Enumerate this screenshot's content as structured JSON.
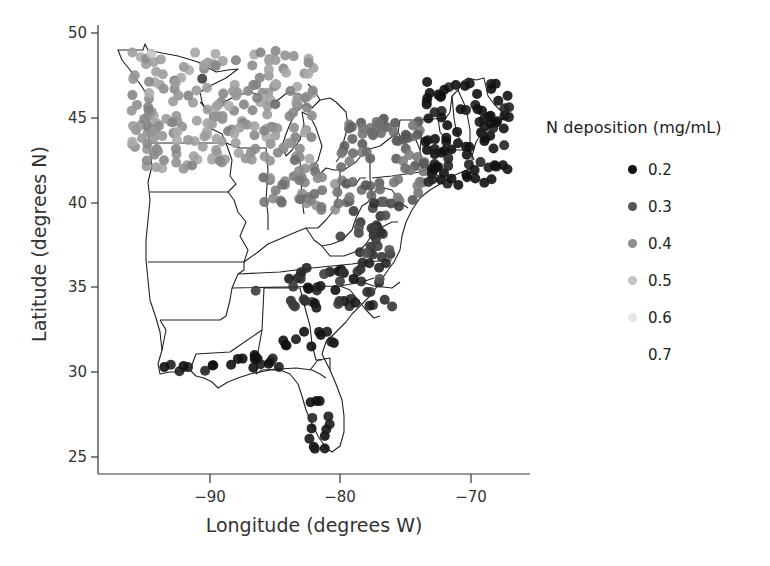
{
  "chart_data": {
    "type": "scatter",
    "subtype": "geographic point map (eastern United States)",
    "title": "",
    "xlabel": "Longitude (degrees W)",
    "ylabel": "Latitude (degrees N)",
    "xlim": [
      -98,
      -65
    ],
    "ylim": [
      24.2,
      50.2
    ],
    "xticks": [
      -90,
      -80,
      -70
    ],
    "xtick_labels": [
      "−90",
      "−80",
      "−70"
    ],
    "yticks": [
      25,
      30,
      35,
      40,
      45,
      50
    ],
    "ytick_labels": [
      "25",
      "30",
      "35",
      "40",
      "45",
      "50"
    ],
    "grid": false,
    "legend": {
      "title": "N deposition (mg/mL)",
      "position": "right",
      "entries": [
        {
          "label": "0.2",
          "value": 0.2,
          "color": "#111111"
        },
        {
          "label": "0.3",
          "value": 0.3,
          "color": "#555555"
        },
        {
          "label": "0.4",
          "value": 0.4,
          "color": "#8e8e8e"
        },
        {
          "label": "0.5",
          "value": 0.5,
          "color": "#c4c4c4"
        },
        {
          "label": "0.6",
          "value": 0.6,
          "color": "#e6e6e6"
        },
        {
          "label": "0.7",
          "value": 0.7,
          "color": "#ffffff"
        }
      ]
    },
    "regions": [
      {
        "name": "Upper Midwest (MN, WI, MI)",
        "lon_range": [
          -96,
          -82
        ],
        "lat_range": [
          42,
          49
        ],
        "approx_value": 0.5
      },
      {
        "name": "Ohio / Indiana",
        "lon_range": [
          -86,
          -80
        ],
        "lat_range": [
          39.5,
          42
        ],
        "approx_value": 0.45
      },
      {
        "name": "New York / Pennsylvania",
        "lon_range": [
          -80,
          -73.5
        ],
        "lat_range": [
          40,
          45
        ],
        "approx_value": 0.4
      },
      {
        "name": "New England",
        "lon_range": [
          -73.5,
          -67
        ],
        "lat_range": [
          41,
          47.2
        ],
        "approx_value": 0.2
      },
      {
        "name": "Mid-Atlantic (MD, VA)",
        "lon_range": [
          -79,
          -75.5
        ],
        "lat_range": [
          36.5,
          40
        ],
        "approx_value": 0.3
      },
      {
        "name": "North Carolina",
        "lon_range": [
          -84,
          -76
        ],
        "lat_range": [
          33.8,
          36.5
        ],
        "approx_value": 0.25
      },
      {
        "name": "Gulf Coast (AL, FL panhandle)",
        "lon_range": [
          -88.5,
          -84.5
        ],
        "lat_range": [
          30,
          31.3
        ],
        "approx_value": 0.2
      },
      {
        "name": "Georgia / South Carolina",
        "lon_range": [
          -84.5,
          -80.5
        ],
        "lat_range": [
          31.5,
          32.5
        ],
        "approx_value": 0.2
      },
      {
        "name": "Louisiana",
        "lon_range": [
          -93.5,
          -89.5
        ],
        "lat_range": [
          30,
          30.5
        ],
        "approx_value": 0.2
      },
      {
        "name": "Florida coast",
        "lon_range": [
          -82.5,
          -80.8
        ],
        "lat_range": [
          25.3,
          28.5
        ],
        "approx_value": 0.2
      }
    ],
    "points_sample": [
      {
        "lon": -94.5,
        "lat": 48.8,
        "value": 0.6
      },
      {
        "lon": -92.0,
        "lat": 48.0,
        "value": 0.5
      },
      {
        "lon": -90.6,
        "lat": 47.3,
        "value": 0.3
      },
      {
        "lon": -88.0,
        "lat": 46.3,
        "value": 0.5
      },
      {
        "lon": -85.0,
        "lat": 45.8,
        "value": 0.4
      },
      {
        "lon": -84.0,
        "lat": 43.5,
        "value": 0.5
      },
      {
        "lon": -83.5,
        "lat": 42.5,
        "value": 0.4
      },
      {
        "lon": -82.0,
        "lat": 40.5,
        "value": 0.4
      },
      {
        "lon": -84.5,
        "lat": 40.0,
        "value": 0.4
      },
      {
        "lon": -78.0,
        "lat": 43.0,
        "value": 0.4
      },
      {
        "lon": -75.0,
        "lat": 44.0,
        "value": 0.35
      },
      {
        "lon": -73.0,
        "lat": 42.0,
        "value": 0.2
      },
      {
        "lon": -71.0,
        "lat": 43.5,
        "value": 0.2
      },
      {
        "lon": -69.5,
        "lat": 45.5,
        "value": 0.2
      },
      {
        "lon": -68.0,
        "lat": 44.8,
        "value": 0.2
      },
      {
        "lon": -70.3,
        "lat": 41.5,
        "value": 0.2
      },
      {
        "lon": -77.5,
        "lat": 38.5,
        "value": 0.3
      },
      {
        "lon": -79.0,
        "lat": 39.5,
        "value": 0.3
      },
      {
        "lon": -80.0,
        "lat": 38.0,
        "value": 0.3
      },
      {
        "lon": -77.0,
        "lat": 35.5,
        "value": 0.35
      },
      {
        "lon": -79.0,
        "lat": 35.5,
        "value": 0.2
      },
      {
        "lon": -82.5,
        "lat": 35.0,
        "value": 0.2
      },
      {
        "lon": -86.5,
        "lat": 34.8,
        "value": 0.3
      },
      {
        "lon": -87.5,
        "lat": 30.8,
        "value": 0.2
      },
      {
        "lon": -85.5,
        "lat": 30.5,
        "value": 0.2
      },
      {
        "lon": -81.5,
        "lat": 32.2,
        "value": 0.2
      },
      {
        "lon": -84.2,
        "lat": 31.6,
        "value": 0.2
      },
      {
        "lon": -93.5,
        "lat": 30.3,
        "value": 0.2
      },
      {
        "lon": -89.8,
        "lat": 30.4,
        "value": 0.2
      },
      {
        "lon": -81.2,
        "lat": 25.5,
        "value": 0.2
      }
    ]
  },
  "legend_title": "N deposition (mg/mL)",
  "legend_labels": [
    "0.2",
    "0.3",
    "0.4",
    "0.5",
    "0.6",
    "0.7"
  ]
}
